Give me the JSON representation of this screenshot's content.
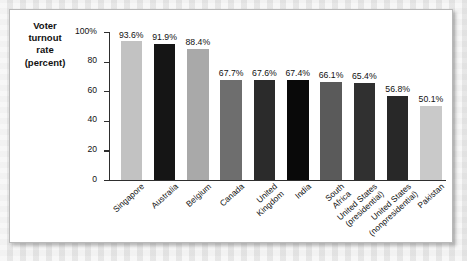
{
  "figure": {
    "panel_background": "#ffffff",
    "border_color": "#b9b9b9"
  },
  "chart_data": {
    "type": "bar",
    "title": "",
    "xlabel": "",
    "ylabel": "Voter turnout rate (percent)",
    "ylabel_lines": [
      "Voter",
      "turnout",
      "rate",
      "(percent)"
    ],
    "ylim": [
      0,
      100
    ],
    "yticks": [
      0,
      20,
      40,
      60,
      80,
      100
    ],
    "ytick_labels": [
      "0",
      "20",
      "40",
      "60",
      "80",
      "100%"
    ],
    "grid": false,
    "legend": null,
    "categories": [
      "Singapore",
      "Australia",
      "Belgium",
      "Canada",
      "United Kingdom",
      "India",
      "South Africa",
      "United States (presidential)",
      "United States (nonpresidential)",
      "Pakistan"
    ],
    "category_label_lines": [
      [
        "Singapore"
      ],
      [
        "Australia"
      ],
      [
        "Belgium"
      ],
      [
        "Canada"
      ],
      [
        "United",
        "Kingdom"
      ],
      [
        "India"
      ],
      [
        "South",
        "Africa"
      ],
      [
        "United States",
        "(presidential)"
      ],
      [
        "United States",
        "(nonpresidential)"
      ],
      [
        "Pakistan"
      ]
    ],
    "values": [
      93.6,
      91.9,
      88.4,
      67.7,
      67.6,
      67.4,
      66.1,
      65.4,
      56.8,
      50.1
    ],
    "value_labels": [
      "93.6%",
      "91.9%",
      "88.4%",
      "67.7%",
      "67.6%",
      "67.4%",
      "66.1%",
      "65.4%",
      "56.8%",
      "50.1%"
    ],
    "bar_colors": [
      "#c2c2c2",
      "#151515",
      "#a9a9a9",
      "#6e6e6e",
      "#2b2b2b",
      "#090909",
      "#5a5a5a",
      "#303030",
      "#282828",
      "#c9c9c9"
    ]
  }
}
